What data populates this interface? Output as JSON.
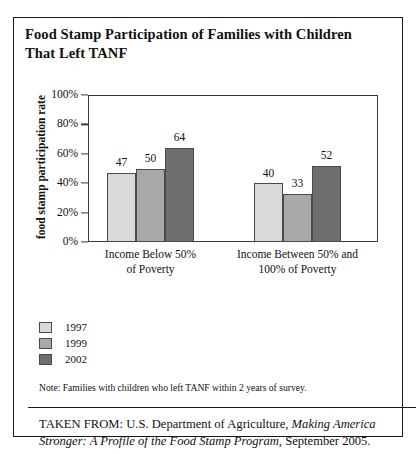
{
  "title": "Food Stamp Participation of Families with Children That Left TANF",
  "note": "Note: Families with children who left TANF within 2 years of survey.",
  "source": {
    "prefix": "TAKEN FROM: U.S. Department of Agriculture, ",
    "italic": "Making America Stronger: A Profile of the Food Stamp Program",
    "suffix": ", September 2005."
  },
  "colors": {
    "series_1997": "#d9d9d9",
    "series_1999": "#a9a9a9",
    "series_2002": "#6f6f6f",
    "border": "#1a1a1a"
  },
  "chart_data": {
    "type": "bar",
    "title": "Food Stamp Participation of Families with Children That Left TANF",
    "xlabel": "",
    "ylabel": "food stamp participation rate",
    "ylim": [
      0,
      100
    ],
    "grid": false,
    "legend_position": "below-left",
    "ytick_labels": [
      "100%",
      "80%",
      "60%",
      "40%",
      "20%",
      "0%"
    ],
    "ytick_values": [
      100,
      80,
      60,
      40,
      20,
      0
    ],
    "categories": [
      "Income Below 50% of Poverty",
      "Income Between 50% and 100% of Poverty"
    ],
    "category_lines": [
      [
        "Income Below 50%",
        "of Poverty"
      ],
      [
        "Income Between 50% and",
        "100% of Poverty"
      ]
    ],
    "series": [
      {
        "name": "1997",
        "values": [
          47,
          40
        ]
      },
      {
        "name": "1999",
        "values": [
          50,
          33
        ]
      },
      {
        "name": "2002",
        "values": [
          64,
          52
        ]
      }
    ]
  }
}
